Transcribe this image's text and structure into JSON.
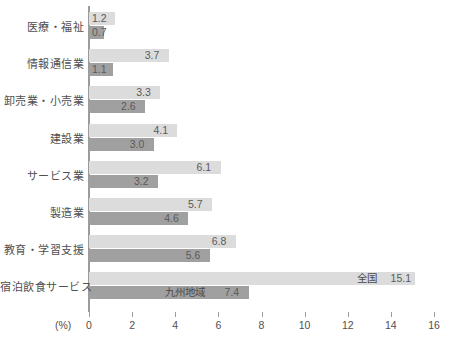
{
  "chart_data": {
    "type": "bar",
    "orientation": "horizontal",
    "title": "",
    "xlabel": "(%)",
    "ylabel": "",
    "xlim": [
      0,
      16
    ],
    "xticks": [
      0,
      2,
      4,
      6,
      8,
      10,
      12,
      14,
      16
    ],
    "xtick_labels": [
      "0",
      "2",
      "4",
      "6",
      "8",
      "10",
      "12",
      "14",
      "16"
    ],
    "grid": false,
    "legend_position": "inline-on-bottom-bars",
    "categories": [
      "医療・福祉",
      "情報通信業",
      "卸売業・小売業",
      "建設業",
      "サービス業",
      "製造業",
      "教育・学習支援",
      "宿泊飲食サービス"
    ],
    "series": [
      {
        "name": "全国",
        "color": "#dcdcdc",
        "values": [
          1.2,
          3.7,
          3.3,
          4.1,
          6.1,
          5.7,
          6.8,
          15.1
        ],
        "labels": [
          "1.2",
          "3.7",
          "3.3",
          "4.1",
          "6.1",
          "5.7",
          "6.8",
          "15.1"
        ]
      },
      {
        "name": "九州地域",
        "color": "#a0a0a0",
        "values": [
          0.7,
          1.1,
          2.6,
          3.0,
          3.2,
          4.6,
          5.6,
          7.4
        ],
        "labels": [
          "0.7",
          "1.1",
          "2.6",
          "3.0",
          "3.2",
          "4.6",
          "5.6",
          "7.4"
        ]
      }
    ],
    "annotations": [
      {
        "text": "全国",
        "attached_to": "宿泊飲食サービス / 全国"
      },
      {
        "text": "九州地域",
        "attached_to": "宿泊飲食サービス / 九州地域"
      }
    ]
  },
  "axis": {
    "unit_label": "(%)"
  }
}
